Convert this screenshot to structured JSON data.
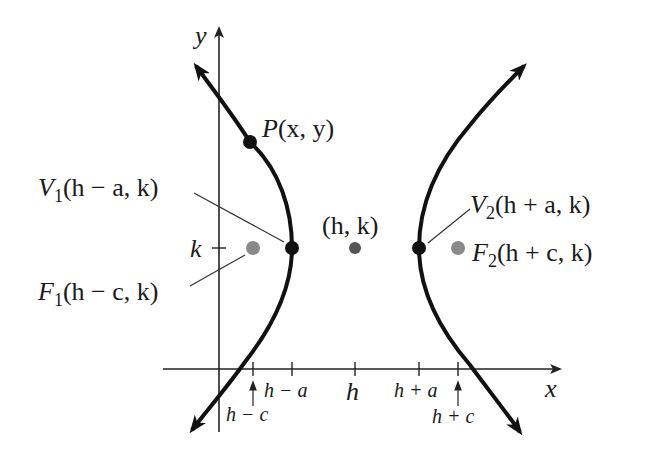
{
  "diagram": {
    "type": "hyperbola-horizontal-transverse-axis",
    "colors": {
      "curve": "#111111",
      "axis": "#222222",
      "vertex": "#111111",
      "focus": "#8a8a8a",
      "center": "#555555",
      "leader": "#333333"
    },
    "axes": {
      "x_label": "x",
      "y_label": "y",
      "k_label": "k"
    },
    "ticks": {
      "h_minus_c": "h − c",
      "h_minus_a": "h − a",
      "h": "h",
      "h_plus_a": "h + a",
      "h_plus_c": "h + c"
    },
    "points": {
      "P": {
        "name": "P",
        "coords": "(x, y)"
      },
      "V1": {
        "name": "V",
        "sub": "1",
        "coords": "(h − a, k)"
      },
      "V2": {
        "name": "V",
        "sub": "2",
        "coords": "(h + a, k)"
      },
      "center": {
        "coords": "(h, k)"
      },
      "F1": {
        "name": "F",
        "sub": "1",
        "coords": "(h − c, k)"
      },
      "F2": {
        "name": "F",
        "sub": "2",
        "coords": "(h + c, k)"
      }
    }
  }
}
